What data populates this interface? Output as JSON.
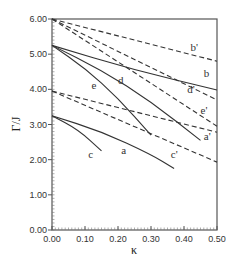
{
  "chart_data": {
    "type": "line",
    "title": "",
    "xlabel": "κ",
    "ylabel": "Γ/J",
    "xlim": [
      0.0,
      0.5
    ],
    "ylim": [
      0.0,
      6.0
    ],
    "x_ticks": [
      "0.00",
      "0.10",
      "0.20",
      "0.30",
      "0.40",
      "0.50"
    ],
    "y_ticks": [
      "0.00",
      "1.00",
      "2.00",
      "3.00",
      "4.00",
      "5.00",
      "6.00"
    ],
    "grid": false,
    "legend": "none (curves labeled inline)",
    "series": [
      {
        "name": "b'",
        "style": "dashed",
        "x": [
          0.0,
          0.5
        ],
        "y": [
          6.0,
          4.8
        ],
        "label_pos": [
          0.42,
          5.1
        ]
      },
      {
        "name": "d'",
        "style": "dashed",
        "x": [
          0.0,
          0.5
        ],
        "y": [
          6.0,
          3.7
        ],
        "label_pos": [
          0.41,
          3.9
        ]
      },
      {
        "name": "e'",
        "style": "dashed",
        "x": [
          0.0,
          0.5
        ],
        "y": [
          6.0,
          2.95
        ],
        "label_pos": [
          0.45,
          3.3
        ]
      },
      {
        "name": "b",
        "style": "solid",
        "x": [
          0.0,
          0.25,
          0.5
        ],
        "y": [
          5.25,
          4.55,
          3.98
        ],
        "label_pos": [
          0.46,
          4.35
        ]
      },
      {
        "name": "d",
        "style": "solid",
        "x": [
          0.0,
          0.15,
          0.3,
          0.45
        ],
        "y": [
          5.25,
          4.55,
          3.65,
          2.55
        ],
        "label_pos": [
          0.2,
          4.15
        ]
      },
      {
        "name": "e",
        "style": "solid",
        "x": [
          0.0,
          0.1,
          0.2,
          0.3
        ],
        "y": [
          5.25,
          4.6,
          3.75,
          2.7
        ],
        "label_pos": [
          0.12,
          4.0
        ]
      },
      {
        "name": "a'",
        "style": "dashed",
        "x": [
          0.0,
          0.5
        ],
        "y": [
          3.95,
          2.78
        ],
        "label_pos": [
          0.46,
          2.55
        ]
      },
      {
        "name": "c'",
        "style": "dashed",
        "x": [
          0.0,
          0.5
        ],
        "y": [
          3.95,
          1.93
        ],
        "label_pos": [
          0.36,
          2.05
        ]
      },
      {
        "name": "a",
        "style": "solid",
        "x": [
          0.0,
          0.15,
          0.3,
          0.37
        ],
        "y": [
          3.25,
          2.8,
          2.15,
          1.75
        ],
        "label_pos": [
          0.21,
          2.15
        ]
      },
      {
        "name": "c",
        "style": "solid",
        "x": [
          0.0,
          0.08,
          0.15
        ],
        "y": [
          3.25,
          2.85,
          2.25
        ],
        "label_pos": [
          0.11,
          2.05
        ]
      }
    ]
  }
}
